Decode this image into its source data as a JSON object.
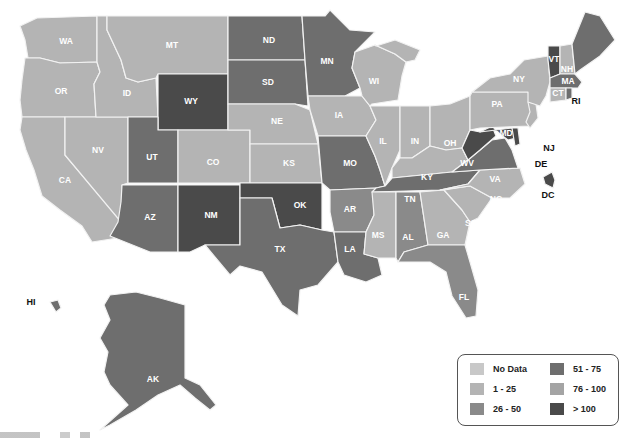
{
  "legend": {
    "items": [
      {
        "label": "No Data",
        "color": "#c8c8c8"
      },
      {
        "label": "1 - 25",
        "color": "#b4b4b4"
      },
      {
        "label": "26 - 50",
        "color": "#8a8a8a"
      },
      {
        "label": "51 - 75",
        "color": "#6e6e6e"
      },
      {
        "label": "76 - 100",
        "color": "#a4a4a4"
      },
      {
        "label": "> 100",
        "color": "#4a4a4a"
      }
    ]
  },
  "states": {
    "WA": {
      "label": "WA",
      "category": "1 - 25"
    },
    "OR": {
      "label": "OR",
      "category": "1 - 25"
    },
    "CA": {
      "label": "CA",
      "category": "1 - 25"
    },
    "ID": {
      "label": "ID",
      "category": "1 - 25"
    },
    "NV": {
      "label": "NV",
      "category": "1 - 25"
    },
    "MT": {
      "label": "MT",
      "category": "1 - 25"
    },
    "WY": {
      "label": "WY",
      "category": "> 100"
    },
    "UT": {
      "label": "UT",
      "category": "51 - 75"
    },
    "CO": {
      "label": "CO",
      "category": "1 - 25"
    },
    "AZ": {
      "label": "AZ",
      "category": "51 - 75"
    },
    "NM": {
      "label": "NM",
      "category": "> 100"
    },
    "ND": {
      "label": "ND",
      "category": "51 - 75"
    },
    "SD": {
      "label": "SD",
      "category": "51 - 75"
    },
    "NE": {
      "label": "NE",
      "category": "1 - 25"
    },
    "KS": {
      "label": "KS",
      "category": "1 - 25"
    },
    "OK": {
      "label": "OK",
      "category": "> 100"
    },
    "TX": {
      "label": "TX",
      "category": "51 - 75"
    },
    "MN": {
      "label": "MN",
      "category": "51 - 75"
    },
    "IA": {
      "label": "IA",
      "category": "1 - 25"
    },
    "MO": {
      "label": "MO",
      "category": "51 - 75"
    },
    "AR": {
      "label": "AR",
      "category": "26 - 50"
    },
    "LA": {
      "label": "LA",
      "category": "51 - 75"
    },
    "WI": {
      "label": "WI",
      "category": "1 - 25"
    },
    "IL": {
      "label": "IL",
      "category": "1 - 25"
    },
    "MI": {
      "label": "MI",
      "category": "1 - 25"
    },
    "IN": {
      "label": "IN",
      "category": "1 - 25"
    },
    "OH": {
      "label": "OH",
      "category": "1 - 25"
    },
    "KY": {
      "label": "KY",
      "category": "1 - 25"
    },
    "TN": {
      "label": "TN",
      "category": "51 - 75"
    },
    "MS": {
      "label": "MS",
      "category": "1 - 25"
    },
    "AL": {
      "label": "AL",
      "category": "26 - 50"
    },
    "GA": {
      "label": "GA",
      "category": "1 - 25"
    },
    "FL": {
      "label": "FL",
      "category": "26 - 50"
    },
    "SC": {
      "label": "SC",
      "category": "1 - 25"
    },
    "NC": {
      "label": "NC",
      "category": "1 - 25"
    },
    "VA": {
      "label": "VA",
      "category": "51 - 75"
    },
    "WV": {
      "label": "WV",
      "category": "> 100"
    },
    "MD": {
      "label": "MD",
      "category": "> 100"
    },
    "DE": {
      "label": "DE",
      "category": "> 100"
    },
    "NJ": {
      "label": "NJ",
      "category": "1 - 25"
    },
    "PA": {
      "label": "PA",
      "category": "1 - 25"
    },
    "NY": {
      "label": "NY",
      "category": "1 - 25"
    },
    "VT": {
      "label": "VT",
      "category": "> 100"
    },
    "NH": {
      "label": "NH",
      "category": "1 - 25"
    },
    "MA": {
      "label": "MA",
      "category": "51 - 75"
    },
    "CT": {
      "label": "CT",
      "category": "1 - 25"
    },
    "RI": {
      "label": "RI",
      "category": "51 - 75"
    },
    "ME": {
      "label": "ME",
      "category": "51 - 75"
    },
    "DC": {
      "label": "DC",
      "category": "> 100"
    },
    "AK": {
      "label": "AK",
      "category": "51 - 75"
    },
    "HI": {
      "label": "HI",
      "category": "51 - 75"
    }
  }
}
